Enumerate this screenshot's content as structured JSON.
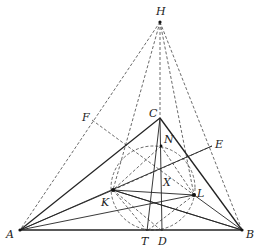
{
  "figure": {
    "type": "geometry-diagram",
    "points": {
      "H": {
        "label": "H",
        "x": 160,
        "y": 22
      },
      "C": {
        "label": "C",
        "x": 160,
        "y": 118
      },
      "A": {
        "label": "A",
        "x": 20,
        "y": 230
      },
      "B": {
        "label": "B",
        "x": 242,
        "y": 230
      },
      "D": {
        "label": "D",
        "x": 162,
        "y": 231
      },
      "T": {
        "label": "T",
        "x": 147,
        "y": 231
      },
      "K": {
        "label": "K",
        "x": 113,
        "y": 190
      },
      "L": {
        "label": "L",
        "x": 194,
        "y": 195
      },
      "N": {
        "label": "N",
        "x": 161,
        "y": 146
      },
      "X": {
        "label": "X",
        "x": 161,
        "y": 170
      },
      "F": {
        "label": "F",
        "x": 92,
        "y": 120
      },
      "E": {
        "label": "E",
        "x": 212,
        "y": 146
      }
    },
    "circle": {
      "cx": 153,
      "cy": 188,
      "r": 42,
      "style": "dashed"
    },
    "labels": [
      "H",
      "C",
      "F",
      "N",
      "E",
      "X",
      "K",
      "L",
      "A",
      "T",
      "D",
      "B"
    ]
  }
}
